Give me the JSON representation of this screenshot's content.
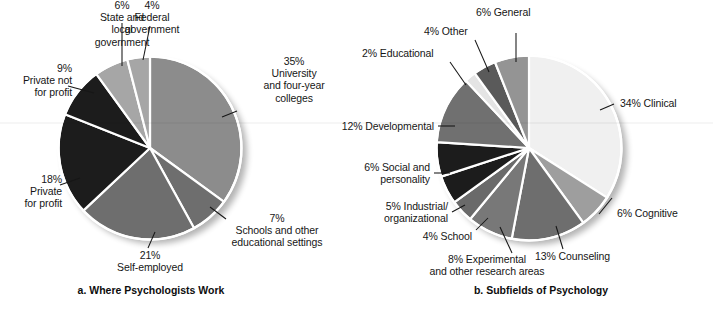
{
  "figure": {
    "background_color": "#ffffff",
    "text_color": "#161616",
    "slice_outline_color": "#ffffff"
  },
  "chart_data": [
    {
      "type": "pie",
      "id": "where-psychologists-work",
      "title": "a. Where Psychologists Work",
      "categories": [
        "University and four-year colleges",
        "Schools and other educational settings",
        "Self-employed",
        "Private for profit",
        "Private not for profit",
        "State and local government",
        "Federal government"
      ],
      "values": [
        35,
        7,
        21,
        18,
        9,
        6,
        4
      ],
      "value_unit": "%",
      "colors": [
        "#8c8c8c",
        "#6e6e6e",
        "#6e6e6e",
        "#1c1c1c",
        "#1c1c1c",
        "#a6a6a6",
        "#a6a6a6"
      ],
      "start_angle_deg": -90,
      "direction": "clockwise",
      "legend": "none",
      "grid": false,
      "labels": [
        {
          "percent": "35%",
          "name": "University\nand four-year\ncolleges"
        },
        {
          "percent": "7%",
          "name": "Schools and other\neducational settings"
        },
        {
          "percent": "21%",
          "name": "Self-employed"
        },
        {
          "percent": "18%",
          "name": "Private\nfor profit"
        },
        {
          "percent": "9%",
          "name": "Private not\nfor profit"
        },
        {
          "percent": "6%",
          "name": "State and\nlocal\ngovernment"
        },
        {
          "percent": "4%",
          "name": "Federal\ngovernment"
        }
      ],
      "label_texts": [
        "35%\nUniversity\nand four-year\ncolleges",
        "7%\nSchools and other\neducational settings",
        "21%\nSelf-employed",
        "18%\nPrivate\nfor profit",
        "9%\nPrivate not\nfor profit",
        "6%\nState and\nlocal\ngovernment",
        "4%\nFederal\ngovernment"
      ]
    },
    {
      "type": "pie",
      "id": "subfields-of-psychology",
      "title": "b. Subfields of Psychology",
      "categories": [
        "Clinical",
        "Cognitive",
        "Counseling",
        "Experimental and other research areas",
        "School",
        "Industrial/organizational",
        "Social and personality",
        "Developmental",
        "Educational",
        "Other",
        "General"
      ],
      "values": [
        34,
        6,
        13,
        8,
        4,
        5,
        6,
        12,
        2,
        4,
        6
      ],
      "value_unit": "%",
      "colors": [
        "#f0f0f0",
        "#9e9e9e",
        "#6e6e6e",
        "#787878",
        "#6a6a6a",
        "#1c1c1c",
        "#1c1c1c",
        "#707070",
        "#e4e4e4",
        "#5a5a5a",
        "#949494"
      ],
      "start_angle_deg": -90,
      "direction": "clockwise",
      "legend": "none",
      "grid": false,
      "label_texts": [
        "34% Clinical",
        "6% Cognitive",
        "13% Counseling",
        "8% Experimental\nand other research areas",
        "4% School",
        "5% Industrial/\norganizational",
        "6% Social and\npersonality",
        "12% Developmental",
        "2% Educational",
        "4% Other",
        "6% General"
      ]
    }
  ],
  "left_chart": {
    "caption": "a. Where Psychologists Work",
    "labels": {
      "university": "35%\nUniversity\nand four-year\ncolleges",
      "schools": "7%\nSchools and other\neducational settings",
      "self_employed": "21%\nSelf-employed",
      "private_for_profit": "18%\nPrivate\nfor profit",
      "private_not_for_profit": "9%\nPrivate not\nfor profit",
      "state_local": "6%\nState and\nlocal\ngovernment",
      "federal": "4%\nFederal\ngovernment"
    }
  },
  "right_chart": {
    "caption": "b. Subfields of Psychology",
    "labels": {
      "general": "6% General",
      "other": "4% Other",
      "educational": "2% Educational",
      "developmental": "12% Developmental",
      "social": "6% Social and\npersonality",
      "industrial": "5% Industrial/\norganizational",
      "school": "4% School",
      "experimental": "8% Experimental\nand other research areas",
      "counseling": "13% Counseling",
      "cognitive": "6% Cognitive",
      "clinical": "34% Clinical"
    }
  }
}
